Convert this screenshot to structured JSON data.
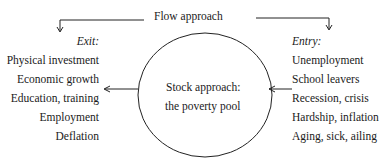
{
  "title": "Flow approach",
  "exit": {
    "heading": "Exit:",
    "items": [
      "Physical investment",
      "Economic growth",
      "Education, training",
      "Employment",
      "Deflation"
    ]
  },
  "entry": {
    "heading": "Entry:",
    "items": [
      "Unemployment",
      "School leavers",
      "Recession, crisis",
      "Hardship, inflation",
      "Aging, sick, ailing"
    ]
  },
  "stock": {
    "line1": "Stock approach:",
    "line2": "the poverty pool"
  }
}
